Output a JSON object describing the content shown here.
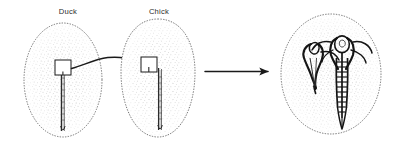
{
  "figure": {
    "background_color": "#ffffff",
    "ink_color": "#1a1a1a",
    "stipple_color": "#6f6f6f",
    "width": 400,
    "height": 147
  },
  "panels": [
    {
      "id": "donor",
      "label": "Duck",
      "label_x": 68,
      "label_y": 14,
      "role": "donor-embryo",
      "blastoderm": {
        "shape": "ellipse",
        "cx": 63,
        "cy": 80,
        "rx": 39,
        "ry": 57,
        "outline": "dotted",
        "fill": "stipple"
      },
      "primitive_streak": {
        "x": 63,
        "y_top": 70,
        "y_bottom": 131,
        "label": "primitive-streak"
      },
      "graft": {
        "label": "graft-square",
        "x": 55,
        "y": 60,
        "w": 16,
        "h": 15,
        "fill": "#ffffff",
        "stroke": "#1a1a1a"
      }
    },
    {
      "id": "host",
      "label": "Chick",
      "label_x": 159,
      "label_y": 14,
      "role": "host-embryo",
      "blastoderm": {
        "shape": "pear",
        "cx": 158,
        "cy": 78,
        "rx": 36,
        "ry": 59,
        "outline": "dotted",
        "fill": "stipple"
      },
      "primitive_streak": {
        "x": 159,
        "y_top": 68,
        "y_bottom": 130,
        "label": "primitive-streak"
      },
      "graft": {
        "label": "graft-square",
        "x": 141,
        "y": 57,
        "w": 16,
        "h": 15,
        "fill": "#ffffff",
        "stroke": "#1a1a1a"
      }
    },
    {
      "id": "result",
      "label": "",
      "role": "result-embryo",
      "blastoderm": {
        "shape": "ellipse",
        "cx": 331,
        "cy": 74,
        "rx": 50,
        "ry": 60,
        "outline": "dotted",
        "fill": "stipple"
      },
      "axes": [
        {
          "label": "secondary-induced-axis",
          "side": "left",
          "has_somites": false,
          "length": 46
        },
        {
          "label": "primary-host-axis",
          "side": "right",
          "has_somites": true,
          "somite_pairs": 11,
          "length": 78
        }
      ]
    }
  ],
  "arrows": [
    {
      "id": "graft-transfer-arrow",
      "type": "curved",
      "from_panel": "donor",
      "to_panel": "host",
      "x1": 72,
      "y1": 68,
      "x2": 139,
      "y2": 62,
      "label": "transplant"
    },
    {
      "id": "development-arrow",
      "type": "straight",
      "from_panel": "host",
      "to_panel": "result",
      "x1": 205,
      "y1": 71,
      "x2": 272,
      "y2": 71,
      "label": "develops-into"
    }
  ]
}
